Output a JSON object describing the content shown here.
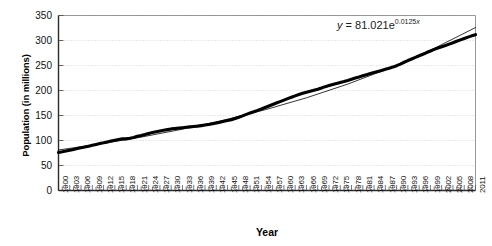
{
  "chart_data": {
    "type": "line",
    "title": "",
    "xlabel": "Year",
    "ylabel": "Population (in millions)",
    "xlim": [
      1900,
      2011
    ],
    "ylim": [
      0,
      350
    ],
    "ytick_values": [
      0,
      50,
      100,
      150,
      200,
      250,
      300,
      350
    ],
    "ytick_labels": [
      "0",
      "50",
      "100",
      "150",
      "200",
      "250",
      "300",
      "350"
    ],
    "xtick_labels": [
      "1900",
      "1903",
      "1906",
      "1909",
      "1912",
      "1915",
      "1918",
      "1921",
      "1924",
      "1927",
      "1930",
      "1933",
      "1936",
      "1939",
      "1942",
      "1945",
      "1948",
      "1951",
      "1954",
      "1957",
      "1960",
      "1963",
      "1966",
      "1969",
      "1972",
      "1975",
      "1978",
      "1981",
      "1984",
      "1987",
      "1990",
      "1993",
      "1996",
      "1999",
      "2002",
      "2005",
      "2008",
      "2011"
    ],
    "xtick_step": 3,
    "minor_tick_step": 1,
    "grid": true,
    "grid_axis": "y",
    "grid_style": "dotted",
    "legend": "none",
    "annotations": [
      {
        "name": "trendline-equation",
        "text": "y = 81.021e^0.0125x",
        "display": "y = 81.021e",
        "exponent": "0.0125x"
      }
    ],
    "series": [
      {
        "name": "population",
        "style": "thick-black-line",
        "x": [
          1900,
          1901,
          1902,
          1903,
          1904,
          1905,
          1906,
          1907,
          1908,
          1909,
          1910,
          1911,
          1912,
          1913,
          1914,
          1915,
          1916,
          1917,
          1918,
          1919,
          1920,
          1921,
          1922,
          1923,
          1924,
          1925,
          1926,
          1927,
          1928,
          1929,
          1930,
          1931,
          1932,
          1933,
          1934,
          1935,
          1936,
          1937,
          1938,
          1939,
          1940,
          1941,
          1942,
          1943,
          1944,
          1945,
          1946,
          1947,
          1948,
          1949,
          1950,
          1951,
          1952,
          1953,
          1954,
          1955,
          1956,
          1957,
          1958,
          1959,
          1960,
          1961,
          1962,
          1963,
          1964,
          1965,
          1966,
          1967,
          1968,
          1969,
          1970,
          1971,
          1972,
          1973,
          1974,
          1975,
          1976,
          1977,
          1978,
          1979,
          1980,
          1981,
          1982,
          1983,
          1984,
          1985,
          1986,
          1987,
          1988,
          1989,
          1990,
          1991,
          1992,
          1993,
          1994,
          1995,
          1996,
          1997,
          1998,
          1999,
          2000,
          2001,
          2002,
          2003,
          2004,
          2005,
          2006,
          2007,
          2008,
          2009,
          2010,
          2011
        ],
        "y": [
          76.2,
          77.6,
          79.2,
          80.6,
          82.2,
          83.8,
          85.4,
          87.0,
          88.7,
          90.5,
          92.2,
          93.9,
          95.3,
          97.2,
          99.1,
          100.5,
          102.0,
          103.3,
          103.2,
          104.5,
          106.0,
          108.5,
          110.1,
          112.0,
          114.1,
          115.8,
          117.4,
          119.0,
          120.5,
          121.8,
          123.2,
          124.0,
          124.8,
          125.6,
          126.4,
          127.3,
          128.1,
          128.8,
          129.8,
          130.9,
          132.1,
          133.4,
          134.9,
          136.7,
          138.4,
          139.9,
          141.4,
          144.1,
          146.6,
          149.2,
          152.3,
          154.9,
          157.6,
          160.2,
          163.0,
          165.9,
          168.9,
          172.0,
          174.9,
          177.8,
          180.7,
          183.7,
          186.5,
          189.2,
          191.9,
          194.3,
          196.6,
          198.7,
          200.7,
          202.7,
          205.1,
          207.7,
          209.9,
          211.9,
          213.9,
          216.0,
          218.0,
          220.2,
          222.6,
          225.1,
          227.2,
          229.5,
          231.7,
          233.8,
          235.8,
          237.9,
          240.1,
          242.3,
          244.5,
          246.8,
          249.6,
          252.9,
          256.5,
          259.9,
          263.1,
          266.3,
          269.4,
          272.6,
          275.9,
          279.0,
          282.2,
          285.0,
          287.6,
          290.1,
          292.8,
          295.5,
          298.4,
          301.2,
          304.1,
          306.8,
          309.3,
          311.6
        ]
      },
      {
        "name": "exponential-trendline",
        "style": "thin-black-line",
        "fit": "y = 81.021e^(0.0125x)",
        "x": [
          1900,
          1911,
          1922,
          1933,
          1944,
          1955,
          1966,
          1977,
          1988,
          1999,
          2011
        ],
        "y": [
          81.0,
          93.0,
          106.8,
          122.6,
          140.7,
          161.5,
          185.4,
          212.8,
          244.3,
          280.4,
          325.9
        ]
      }
    ]
  }
}
